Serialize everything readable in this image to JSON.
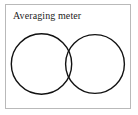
{
  "figure": {
    "label": "Averaging meter",
    "frame": {
      "border_color": "#b9b9b9",
      "background_color": "#ffffff"
    },
    "text_color": "#1d1d1d",
    "stroke_color": "#121212"
  },
  "diagram": {
    "type": "two-tangent-circles",
    "circles": [
      {
        "name": "left-dial",
        "cx": 36.5,
        "cy": 60,
        "r": 30.2
      },
      {
        "name": "right-dial",
        "cx": 90.0,
        "cy": 60,
        "r": 29.4
      }
    ]
  }
}
